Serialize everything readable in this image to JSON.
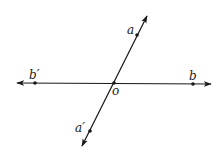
{
  "diagram": {
    "title": "",
    "type": "intersecting-lines",
    "colors": {
      "stroke": "#1a1a1a",
      "background": "#ffffff"
    },
    "lines": [
      {
        "id": "bb-prime",
        "from": "b'",
        "to": "b",
        "orientation": "horizontal",
        "arrows": "both"
      },
      {
        "id": "aa-prime",
        "from": "a'",
        "to": "a",
        "orientation": "oblique",
        "arrows": "both"
      }
    ],
    "points": {
      "a": {
        "label": "a"
      },
      "a_prime": {
        "label": "a′"
      },
      "b": {
        "label": "b"
      },
      "b_prime": {
        "label": "b′"
      },
      "o": {
        "label": "o"
      }
    }
  }
}
